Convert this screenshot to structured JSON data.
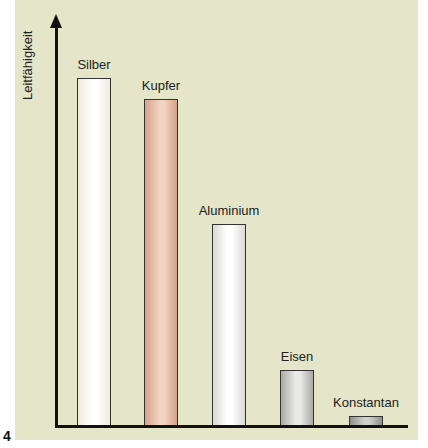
{
  "figure_number": "4",
  "chart_data": {
    "type": "bar",
    "title": "",
    "xlabel": "",
    "ylabel": "Leitfähigkeit",
    "categories": [
      "Silber",
      "Kupfer",
      "Aluminium",
      "Eisen",
      "Konstantan"
    ],
    "values": [
      100,
      94,
      58,
      16,
      3
    ],
    "value_unit": "relative (no scale shown, estimated from bar heights)",
    "ylim": [
      0,
      110
    ],
    "grid": false,
    "legend": null,
    "colors": [
      "#fbfaf2",
      "#e0b59e",
      "#ecece8",
      "#c4c4c0",
      "#a5a5a2"
    ]
  },
  "axis": {
    "ylabel": "Leitfähigkeit"
  },
  "bars": [
    {
      "label": "Silber",
      "color_light": "#ffffff",
      "color_dark": "#eeeadc"
    },
    {
      "label": "Kupfer",
      "color_light": "#f1d3c2",
      "color_dark": "#d5a48a"
    },
    {
      "label": "Aluminium",
      "color_light": "#ffffff",
      "color_dark": "#d8d8d6"
    },
    {
      "label": "Eisen",
      "color_light": "#e9e9e7",
      "color_dark": "#a9a9a6"
    },
    {
      "label": "Konstantan",
      "color_light": "#cfcfcc",
      "color_dark": "#8f8f8c"
    }
  ]
}
